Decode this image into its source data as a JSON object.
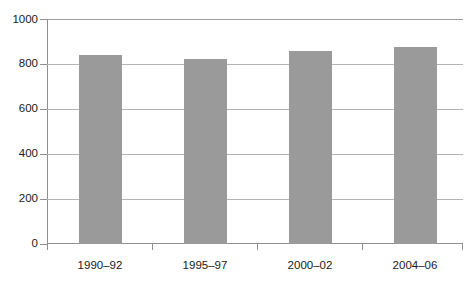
{
  "chart_data": {
    "type": "bar",
    "title": "",
    "subtitle": "",
    "xlabel": "",
    "ylabel": "",
    "categories": [
      "1990–92",
      "1995–97",
      "2000–02",
      "2004–06"
    ],
    "values": [
      844,
      826,
      863,
      878
    ],
    "series": [
      {
        "name": "",
        "values": [
          844,
          826,
          863,
          878
        ]
      }
    ],
    "ylim": [
      0,
      1000
    ],
    "ytick_labels": [
      "0",
      "200",
      "400",
      "600",
      "800",
      "1000"
    ],
    "ytick_values": [
      0,
      200,
      400,
      600,
      800,
      1000
    ],
    "grid": "horizontal",
    "legend": "none",
    "annotations": [],
    "colors": {
      "bar_fill": "#9a9a9a",
      "gridline": "#b3b3b3",
      "axis_line": "#8f8f8f",
      "tick_label": "#1a1a1a",
      "background": "#ffffff"
    }
  }
}
